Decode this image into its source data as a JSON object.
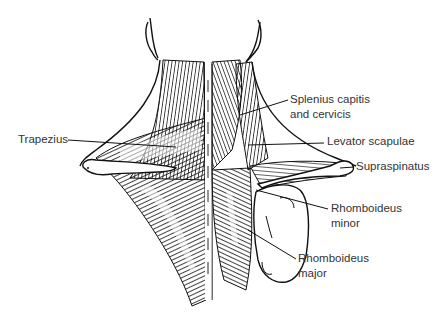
{
  "figure": {
    "style": "black-and-white anatomical line drawing"
  },
  "labels": {
    "trapezius": {
      "lines": [
        "Trapezius"
      ]
    },
    "splenius": {
      "lines": [
        "Splenius capitis",
        "and cervicis"
      ]
    },
    "levator": {
      "lines": [
        "Levator scapulae"
      ]
    },
    "supraspinatus": {
      "lines": [
        "Supraspinatus"
      ]
    },
    "rhomboid_minor": {
      "lines": [
        "Rhomboideus",
        "minor"
      ]
    },
    "rhomboid_major": {
      "lines": [
        "Rhomboideus",
        "major"
      ]
    }
  },
  "colors": {
    "ink": "#111111",
    "label_text": "#333333",
    "background": "#ffffff"
  }
}
